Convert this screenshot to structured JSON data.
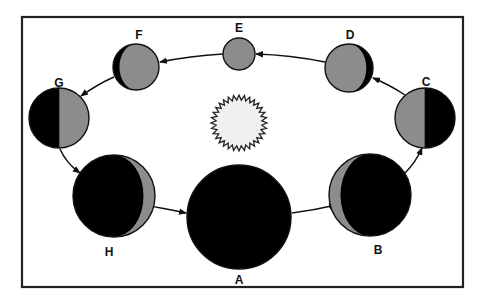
{
  "diagram": {
    "type": "moon-phases-orbit",
    "colors": {
      "lit": "#8c8c8c",
      "dark": "#000000",
      "sun_fill": "#f0f0f0",
      "outline": "#111111",
      "background": "#ffffff"
    },
    "frame": {
      "x": 22,
      "y": 17,
      "width": 441,
      "height": 270
    },
    "sun": {
      "cx": 239,
      "cy": 123,
      "r_outer": 28,
      "r_inner": 23,
      "spikes": 32
    },
    "phases": [
      {
        "label": "A",
        "name": "new-moon",
        "cx": 239,
        "cy": 217,
        "r": 52,
        "label_x": 239,
        "label_y": 284
      },
      {
        "label": "B",
        "name": "waxing-crescent",
        "cx": 370,
        "cy": 195,
        "r": 41,
        "label_x": 378,
        "label_y": 254
      },
      {
        "label": "C",
        "name": "first-quarter",
        "cx": 425,
        "cy": 118,
        "r": 30,
        "label_x": 426,
        "label_y": 86
      },
      {
        "label": "D",
        "name": "waxing-gibbous",
        "cx": 349,
        "cy": 68,
        "r": 24,
        "label_x": 350,
        "label_y": 39
      },
      {
        "label": "E",
        "name": "full-moon",
        "cx": 239,
        "cy": 54,
        "r": 16,
        "label_x": 239,
        "label_y": 32
      },
      {
        "label": "F",
        "name": "waning-gibbous",
        "cx": 136,
        "cy": 67,
        "r": 23,
        "label_x": 139,
        "label_y": 39
      },
      {
        "label": "G",
        "name": "third-quarter",
        "cx": 59,
        "cy": 118,
        "r": 30,
        "label_x": 59,
        "label_y": 87
      },
      {
        "label": "H",
        "name": "waning-crescent",
        "cx": 114,
        "cy": 196,
        "r": 41,
        "label_x": 109,
        "label_y": 256
      }
    ],
    "arrows": [
      {
        "from": "A",
        "to": "B",
        "d": "M292,213 Q315,210 336,205"
      },
      {
        "from": "B",
        "to": "C",
        "d": "M405,173 Q416,162 422,148"
      },
      {
        "from": "C",
        "to": "D",
        "d": "M405,95 Q390,85 373,78"
      },
      {
        "from": "D",
        "to": "E",
        "d": "M325,62 Q290,55 256,54"
      },
      {
        "from": "E",
        "to": "F",
        "d": "M223,54 Q190,56 160,62"
      },
      {
        "from": "F",
        "to": "G",
        "d": "M114,77 Q98,84 81,96"
      },
      {
        "from": "G",
        "to": "H",
        "d": "M60,149 Q66,163 80,173"
      },
      {
        "from": "H",
        "to": "A",
        "d": "M143,205 Q163,208 186,213"
      }
    ]
  }
}
